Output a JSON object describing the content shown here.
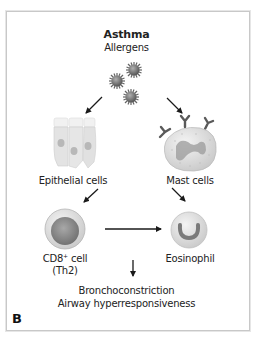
{
  "diagram": {
    "title": "Asthma",
    "trigger": "Allergens",
    "nodes": {
      "epithelial": {
        "label": "Epithelial cells",
        "icon": "epithelial-cells-icon"
      },
      "mast": {
        "label": "Mast cells",
        "icon": "mast-cell-icon"
      },
      "cd8": {
        "label_main": "CD8",
        "label_sup": "+",
        "label_rest": " cell",
        "label_sub": "(Th2)",
        "icon": "cd8-cell-icon"
      },
      "eosinophil": {
        "label": "Eosinophil",
        "icon": "eosinophil-icon"
      }
    },
    "outcome": {
      "line1": "Bronchoconstriction",
      "line2": "Airway hyperresponsiveness"
    },
    "panel_letter": "B",
    "edges": [
      {
        "from": "allergens",
        "to": "epithelial"
      },
      {
        "from": "allergens",
        "to": "mast"
      },
      {
        "from": "epithelial",
        "to": "cd8"
      },
      {
        "from": "mast",
        "to": "eosinophil"
      },
      {
        "from": "cd8",
        "to": "eosinophil"
      },
      {
        "from": "center",
        "to": "outcome"
      }
    ],
    "colors": {
      "frame": "#c8c8c8",
      "allergen": "#7a7a7a",
      "cell_fill": "#e4e4e4",
      "nucleus": "#8a8a8a",
      "arrow": "#1a1a1a"
    }
  }
}
